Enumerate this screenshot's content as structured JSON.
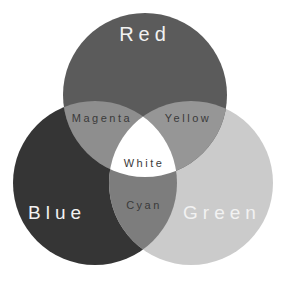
{
  "diagram": {
    "type": "venn",
    "circles": [
      {
        "name": "Red",
        "label": "Red",
        "cx": 145,
        "cy": 95,
        "r": 82,
        "fill": "#5b5b5b"
      },
      {
        "name": "Blue",
        "label": "Blue",
        "cx": 95,
        "cy": 183,
        "r": 82,
        "fill": "#353535"
      },
      {
        "name": "Green",
        "label": "Green",
        "cx": 191,
        "cy": 183,
        "r": 82,
        "fill": "#cbcbcb"
      }
    ],
    "overlaps": {
      "magenta": {
        "label": "Magenta",
        "fill": "#8e8e8e"
      },
      "yellow": {
        "label": "Yellow",
        "fill": "#969696"
      },
      "cyan": {
        "label": "Cyan",
        "fill": "#7d7d7d"
      },
      "white": {
        "label": "White",
        "fill": "#ffffff"
      }
    },
    "colors": {
      "primary_text": "#f2f2f2",
      "overlap_text": "#3a3a3a",
      "background": "#ffffff"
    }
  }
}
